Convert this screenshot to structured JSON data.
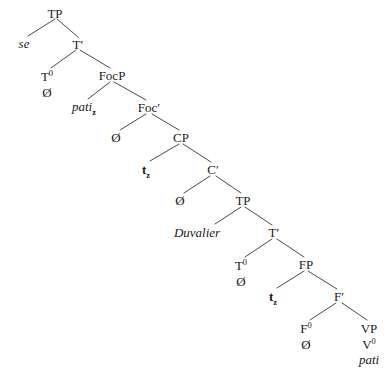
{
  "figure": {
    "kind": "syntactic-tree-diagram",
    "width": 390,
    "height": 376,
    "background_color": "#ffffff",
    "text_color": "#1a1a1a",
    "line_color": "#333333"
  },
  "nodes": {
    "tp_root": "TP",
    "se": "se",
    "t_bar_1": "T′",
    "t0_1": "T",
    "t0_1_sup": "0",
    "t0_1_null": "Ø",
    "focp": "FocP",
    "pati_spec": "pati",
    "pati_spec_sub": "z",
    "foc_bar": "Foc′",
    "foc0_null": "Ø",
    "cp": "CP",
    "trace_z_1": "t",
    "trace_z_1_sub": "z",
    "c_bar": "C′",
    "c0_null": "Ø",
    "tp_embedded": "TP",
    "duvalier": "Duvalier",
    "t_bar_2": "T′",
    "t0_2": "T",
    "t0_2_sup": "0",
    "t0_2_null": "Ø",
    "fp": "FP",
    "trace_z_2": "t",
    "trace_z_2_sub": "z",
    "f_bar": "F′",
    "f0": "F",
    "f0_sup": "0",
    "f0_null": "Ø",
    "vp": "VP",
    "v0": "V",
    "v0_sup": "0",
    "pati_verb": "pati"
  }
}
